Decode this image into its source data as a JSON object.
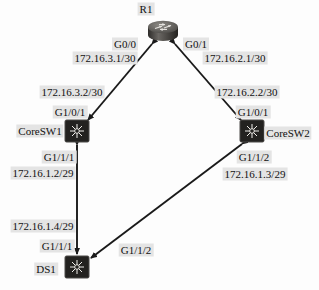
{
  "diagram": {
    "type": "network-topology",
    "background_color": "#fdfdfd",
    "label_highlight_color": "#e4e4e4",
    "link_color": "#1a1a1a",
    "nodes": [
      {
        "id": "r1",
        "name": "R1",
        "device_type": "router",
        "x": 163,
        "y": 31,
        "label_x": 146,
        "label_y": 9
      },
      {
        "id": "coresw1",
        "name": "CoreSW1",
        "device_type": "switch",
        "x": 77,
        "y": 131,
        "label_x": 40,
        "label_y": 131
      },
      {
        "id": "coresw2",
        "name": "CoreSW2",
        "device_type": "switch",
        "x": 252,
        "y": 131,
        "label_x": 288,
        "label_y": 133
      },
      {
        "id": "ds1",
        "name": "DS1",
        "device_type": "switch",
        "x": 77,
        "y": 267,
        "label_x": 46,
        "label_y": 269
      }
    ],
    "links": [
      {
        "id": "r1-coresw1",
        "from": "r1",
        "to": "coresw1",
        "x1": 152,
        "y1": 44,
        "x2": 88,
        "y2": 120
      },
      {
        "id": "r1-coresw2",
        "from": "r1",
        "to": "coresw2",
        "x1": 175,
        "y1": 44,
        "x2": 241,
        "y2": 120
      },
      {
        "id": "coresw1-ds1",
        "from": "coresw1",
        "to": "ds1",
        "x1": 77,
        "y1": 145,
        "x2": 77,
        "y2": 254
      },
      {
        "id": "coresw2-ds1",
        "from": "coresw2",
        "to": "ds1",
        "x1": 242,
        "y1": 144,
        "x2": 91,
        "y2": 258
      }
    ],
    "interface_labels": [
      {
        "id": "r1-g00",
        "text": "G0/0",
        "x": 125,
        "y": 44,
        "highlight": true
      },
      {
        "id": "r1-g00-ip",
        "text": "172.16.3.1/30",
        "x": 105,
        "y": 58,
        "highlight": true
      },
      {
        "id": "r1-g01",
        "text": "G0/1",
        "x": 196,
        "y": 44,
        "highlight": true
      },
      {
        "id": "r1-g01-ip",
        "text": "172.16.2.1/30",
        "x": 235,
        "y": 58,
        "highlight": true
      },
      {
        "id": "sw1-ip",
        "text": "172.16.3.2/30",
        "x": 72,
        "y": 92,
        "highlight": true
      },
      {
        "id": "sw1-g101",
        "text": "G1/0/1",
        "x": 70,
        "y": 112,
        "highlight": true
      },
      {
        "id": "sw2-ip",
        "text": "172.16.2.2/30",
        "x": 247,
        "y": 92,
        "highlight": true
      },
      {
        "id": "sw2-g101",
        "text": "G1/0/1",
        "x": 253,
        "y": 112,
        "highlight": true
      },
      {
        "id": "sw1-g111",
        "text": "G1/1/1",
        "x": 59,
        "y": 157,
        "highlight": true
      },
      {
        "id": "sw1-g111-ip",
        "text": "172.16.1.2/29",
        "x": 43,
        "y": 173,
        "highlight": true
      },
      {
        "id": "sw2-g112",
        "text": "G1/1/2",
        "x": 254,
        "y": 157,
        "highlight": true
      },
      {
        "id": "sw2-g112-ip",
        "text": "172.16.1.3/29",
        "x": 255,
        "y": 174,
        "highlight": true
      },
      {
        "id": "ds1-ip",
        "text": "172.16.1.4/29",
        "x": 43,
        "y": 226,
        "highlight": true
      },
      {
        "id": "ds1-g111",
        "text": "G1/1/1",
        "x": 57,
        "y": 246,
        "highlight": true
      },
      {
        "id": "ds1-g112",
        "text": "G1/1/2",
        "x": 136,
        "y": 250,
        "highlight": true
      }
    ]
  }
}
